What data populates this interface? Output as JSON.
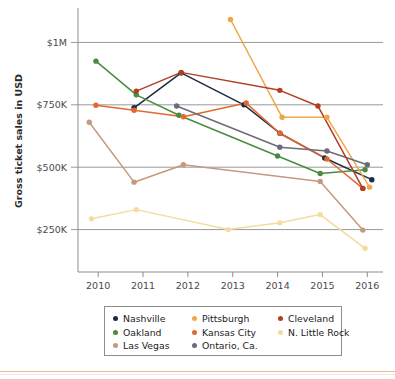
{
  "chart_data": {
    "type": "line",
    "title": "",
    "subtitle": "",
    "xlabel": "",
    "ylabel": "Gross ticket sales in USD",
    "x": [
      2010,
      2011,
      2012,
      2013,
      2014,
      2015,
      2016
    ],
    "xtick_labels": [
      "2010",
      "2011",
      "2012",
      "2013",
      "2014",
      "2015",
      "2016"
    ],
    "ytick_labels": [
      "$250K",
      "$500K",
      "$750K",
      "$1M"
    ],
    "ytick_values": [
      250000,
      500000,
      750000,
      1000000
    ],
    "ylim": [
      80000,
      1130000
    ],
    "xlim": [
      2009.55,
      2016.35
    ],
    "grid": "horizontal",
    "legend_position": "bottom",
    "legend_columns": 3,
    "series": [
      {
        "name": "Nashville",
        "color": "#1d2b42",
        "points": [
          {
            "x": 2010.8,
            "y": 738000
          },
          {
            "x": 2011.85,
            "y": 878000
          },
          {
            "x": 2013.25,
            "y": 750000
          },
          {
            "x": 2014.05,
            "y": 636000
          },
          {
            "x": 2015.05,
            "y": 537000
          },
          {
            "x": 2016.1,
            "y": 450000
          }
        ]
      },
      {
        "name": "Oakland",
        "color": "#4a8c3f",
        "points": [
          {
            "x": 2009.95,
            "y": 925000
          },
          {
            "x": 2010.85,
            "y": 790000
          },
          {
            "x": 2011.8,
            "y": 708000
          },
          {
            "x": 2014.0,
            "y": 545000
          },
          {
            "x": 2014.95,
            "y": 475000
          },
          {
            "x": 2015.95,
            "y": 490000
          }
        ]
      },
      {
        "name": "Las Vegas",
        "color": "#c49a7e",
        "points": [
          {
            "x": 2009.8,
            "y": 680000
          },
          {
            "x": 2010.8,
            "y": 440000
          },
          {
            "x": 2011.9,
            "y": 510000
          },
          {
            "x": 2014.95,
            "y": 443000
          },
          {
            "x": 2015.9,
            "y": 248000
          }
        ]
      },
      {
        "name": "Pittsburgh",
        "color": "#f0a747",
        "points": [
          {
            "x": 2012.95,
            "y": 1092000
          },
          {
            "x": 2014.1,
            "y": 700000
          },
          {
            "x": 2015.1,
            "y": 700000
          },
          {
            "x": 2016.05,
            "y": 420000
          }
        ]
      },
      {
        "name": "Kansas City",
        "color": "#e2682f",
        "points": [
          {
            "x": 2009.95,
            "y": 748000
          },
          {
            "x": 2010.8,
            "y": 728000
          },
          {
            "x": 2011.9,
            "y": 702000
          },
          {
            "x": 2013.3,
            "y": 757000
          },
          {
            "x": 2014.05,
            "y": 636000
          },
          {
            "x": 2015.1,
            "y": 533000
          },
          {
            "x": 2015.9,
            "y": 415000
          }
        ]
      },
      {
        "name": "Ontario, Ca.",
        "color": "#6b6b78",
        "points": [
          {
            "x": 2011.75,
            "y": 745000
          },
          {
            "x": 2014.05,
            "y": 580000
          },
          {
            "x": 2015.1,
            "y": 565000
          },
          {
            "x": 2016.0,
            "y": 510000
          }
        ]
      },
      {
        "name": "Cleveland",
        "color": "#b03f24",
        "points": [
          {
            "x": 2010.85,
            "y": 805000
          },
          {
            "x": 2011.85,
            "y": 880000
          },
          {
            "x": 2014.05,
            "y": 808000
          },
          {
            "x": 2014.9,
            "y": 745000
          },
          {
            "x": 2015.9,
            "y": 415000
          }
        ]
      },
      {
        "name": "N. Little Rock",
        "color": "#f5dba0",
        "points": [
          {
            "x": 2009.85,
            "y": 293000
          },
          {
            "x": 2010.85,
            "y": 330000
          },
          {
            "x": 2012.9,
            "y": 250000
          },
          {
            "x": 2014.05,
            "y": 277000
          },
          {
            "x": 2014.95,
            "y": 310000
          },
          {
            "x": 2015.95,
            "y": 175000
          }
        ]
      }
    ]
  },
  "axis": {
    "y_title": "Gross ticket sales in USD"
  },
  "legend": {
    "entries": [
      {
        "label": "Nashville",
        "color": "#1d2b42"
      },
      {
        "label": "Pittsburgh",
        "color": "#f0a747"
      },
      {
        "label": "Cleveland",
        "color": "#b03f24"
      },
      {
        "label": "Oakland",
        "color": "#4a8c3f"
      },
      {
        "label": "Kansas City",
        "color": "#e2682f"
      },
      {
        "label": "N. Little Rock",
        "color": "#f5dba0"
      },
      {
        "label": "Las Vegas",
        "color": "#c49a7e"
      },
      {
        "label": "Ontario, Ca.",
        "color": "#6b6b78"
      }
    ]
  },
  "style": {
    "gridline_color": "#9a9a9a",
    "axis_color": "#8d8d8d",
    "background": "#ffffff",
    "rule_color": "#f3b68a"
  }
}
